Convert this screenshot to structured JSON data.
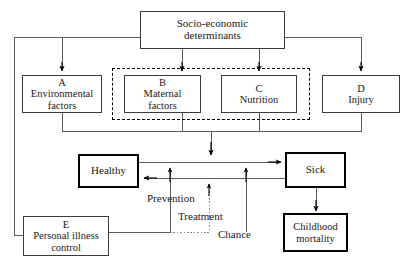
{
  "diagram": {
    "stroke_color": "#3a3a3a",
    "thick_stroke_color": "#000000",
    "background": "#ffffff",
    "nodes": {
      "socio": {
        "line1": "Socio-economic",
        "line2": "determinants"
      },
      "a": {
        "letter": "A",
        "line1": "Environmental",
        "line2": "factors"
      },
      "b": {
        "letter": "B",
        "line1": "Maternal",
        "line2": "factors"
      },
      "c": {
        "letter": "C",
        "line1": "Nutrition",
        "line2": ""
      },
      "d": {
        "letter": "D",
        "line1": "Injury",
        "line2": ""
      },
      "healthy": {
        "label": "Healthy"
      },
      "sick": {
        "label": "Sick"
      },
      "mortality": {
        "line1": "Childhood",
        "line2": "mortality"
      },
      "e": {
        "letter": "E",
        "line1": "Personal illness",
        "line2": "control"
      }
    },
    "edge_labels": {
      "prevention": "Prevention",
      "treatment": "Treatment",
      "chance": "Chance"
    },
    "group": {
      "name": "dashed-group-maternal-nutrition",
      "style": "dashed"
    }
  }
}
